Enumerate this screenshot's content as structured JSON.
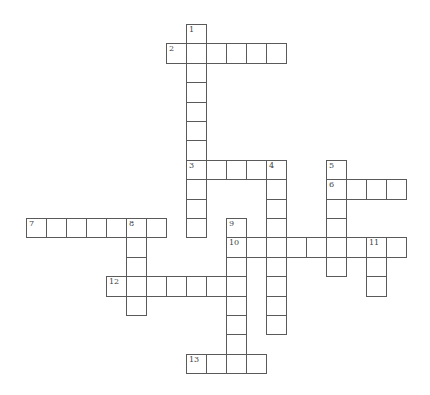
{
  "puzzle": {
    "type": "crossword",
    "words": [
      {
        "number": "1",
        "direction": "down",
        "row": 0,
        "col": 8,
        "length": 11
      },
      {
        "number": "2",
        "direction": "across",
        "row": 1,
        "col": 7,
        "length": 6
      },
      {
        "number": "3",
        "direction": "across",
        "row": 7,
        "col": 8,
        "length": 5
      },
      {
        "number": "4",
        "direction": "down",
        "row": 7,
        "col": 12,
        "length": 9
      },
      {
        "number": "5",
        "direction": "down",
        "row": 7,
        "col": 15,
        "length": 6
      },
      {
        "number": "6",
        "direction": "across",
        "row": 8,
        "col": 15,
        "length": 4
      },
      {
        "number": "7",
        "direction": "across",
        "row": 10,
        "col": 0,
        "length": 7
      },
      {
        "number": "8",
        "direction": "down",
        "row": 10,
        "col": 5,
        "length": 5
      },
      {
        "number": "9",
        "direction": "down",
        "row": 10,
        "col": 10,
        "length": 8
      },
      {
        "number": "10",
        "direction": "across",
        "row": 11,
        "col": 10,
        "length": 9
      },
      {
        "number": "11",
        "direction": "down",
        "row": 11,
        "col": 17,
        "length": 3
      },
      {
        "number": "12",
        "direction": "across",
        "row": 13,
        "col": 4,
        "length": 7
      },
      {
        "number": "13",
        "direction": "across",
        "row": 17,
        "col": 8,
        "length": 4
      }
    ],
    "line_color": "#5a5a5a"
  }
}
